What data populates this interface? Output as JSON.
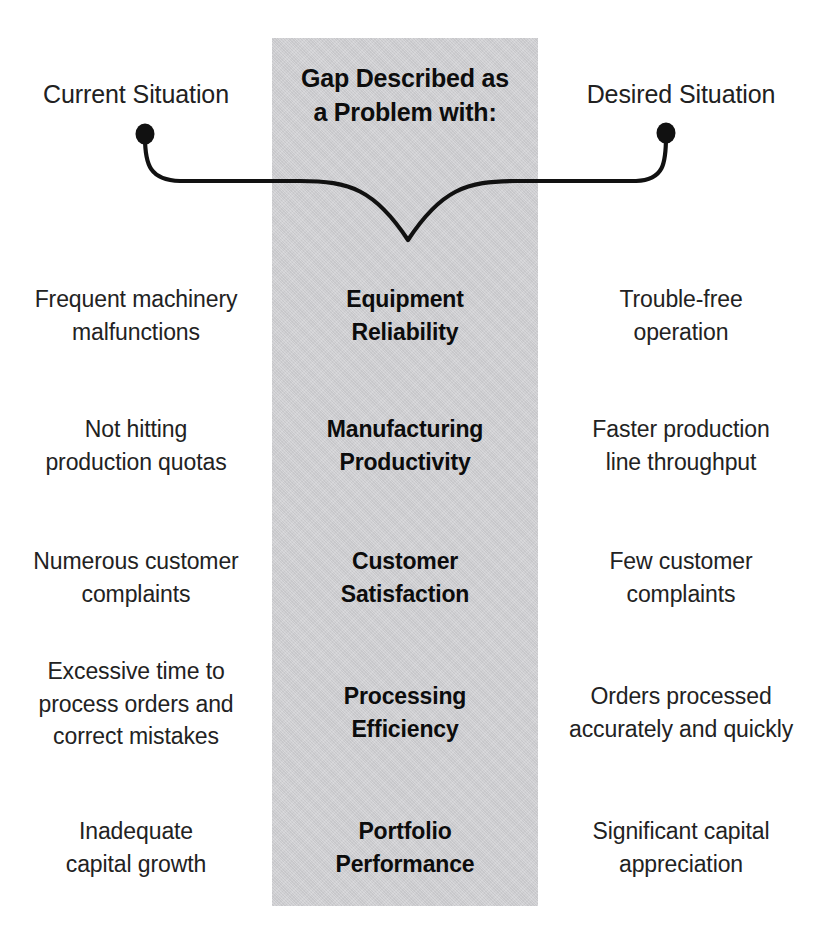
{
  "diagram": {
    "title_center_line1": "Gap Described as",
    "title_center_line2": "a Problem with:",
    "title_left": "Current Situation",
    "title_right": "Desired Situation",
    "band_color": "#cdcdd0",
    "text_color": "#222222",
    "curve_color": "#111111",
    "background_color": "#ffffff"
  },
  "gap_curve": {
    "left_endpoint_label": "current-situation-anchor",
    "right_endpoint_label": "desired-situation-anchor",
    "dip_label": "gap-dip-point"
  },
  "rows": [
    {
      "current": [
        "Frequent machinery",
        "malfunctions"
      ],
      "gap": [
        "Equipment",
        "Reliability"
      ],
      "desired": [
        "Trouble-free",
        "operation"
      ]
    },
    {
      "current": [
        "Not hitting",
        "production quotas"
      ],
      "gap": [
        "Manufacturing",
        "Productivity"
      ],
      "desired": [
        "Faster production",
        "line throughput"
      ]
    },
    {
      "current": [
        "Numerous customer",
        "complaints"
      ],
      "gap": [
        "Customer",
        "Satisfaction"
      ],
      "desired": [
        "Few customer",
        "complaints"
      ]
    },
    {
      "current": [
        "Excessive time to",
        "process orders and",
        "correct mistakes"
      ],
      "gap": [
        "Processing",
        "Efficiency"
      ],
      "desired": [
        "Orders processed",
        "accurately and quickly"
      ]
    },
    {
      "current": [
        "Inadequate",
        "capital growth"
      ],
      "gap": [
        "Portfolio",
        "Performance"
      ],
      "desired": [
        "Significant capital",
        "appreciation"
      ]
    }
  ],
  "layout": {
    "row_tops": [
      283,
      413,
      545,
      655,
      815
    ],
    "row_tops_mid": [
      283,
      413,
      545,
      680,
      815
    ],
    "row_tops_right": [
      283,
      413,
      545,
      680,
      815
    ]
  }
}
